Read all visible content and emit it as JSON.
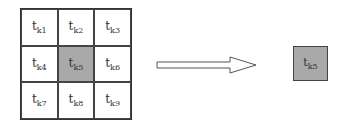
{
  "grid": {
    "cells": [
      {
        "base": "t",
        "sub": "k1",
        "highlight": false
      },
      {
        "base": "t",
        "sub": "k2",
        "highlight": false
      },
      {
        "base": "t",
        "sub": "k3",
        "highlight": false
      },
      {
        "base": "t",
        "sub": "k4",
        "highlight": false
      },
      {
        "base": "t",
        "sub": "k5",
        "highlight": true
      },
      {
        "base": "t",
        "sub": "k6",
        "highlight": false
      },
      {
        "base": "t",
        "sub": "k7",
        "highlight": false
      },
      {
        "base": "t",
        "sub": "k8",
        "highlight": false
      },
      {
        "base": "t",
        "sub": "k9",
        "highlight": false
      }
    ],
    "highlight_color": "#a9a9a9"
  },
  "arrow": {
    "icon": "right-arrow-icon"
  },
  "output": {
    "base": "t",
    "sub": "k5"
  }
}
